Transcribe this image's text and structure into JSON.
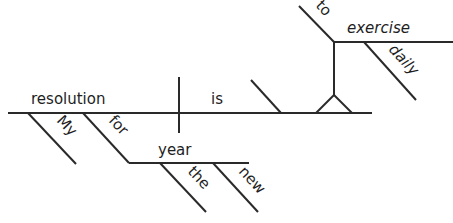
{
  "diagram": {
    "type": "sentence-diagram",
    "sentence": "My resolution for the new year is to exercise daily",
    "subject": "resolution",
    "verb": "is",
    "subject_modifiers": [
      "My"
    ],
    "prepositional_phrase": {
      "preposition": "for",
      "object": "year",
      "object_modifiers": [
        "the",
        "new"
      ]
    },
    "predicate_nominative": {
      "infinitive_marker": "to",
      "verb": "exercise",
      "modifier": "daily"
    },
    "colors": {
      "line": "#2a2a2a",
      "text": "#1e1e1e",
      "background": "#ffffff"
    }
  }
}
